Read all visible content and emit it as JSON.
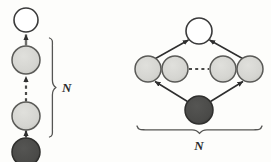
{
  "figure": {
    "background_color": "#fdfdfb"
  },
  "palette": {
    "observed_fill": "#4a4a48",
    "latent_fill": "#d5d5d1",
    "root_fill": "#ffffff",
    "stroke": "#3a3a3a",
    "dashed_stroke": "#4a4a48",
    "brace_stroke": "#555553",
    "label_color": "#2b2b2b"
  },
  "left_diagram": {
    "name": "chain-representation",
    "plate_label": "N",
    "nodes": [
      {
        "id": "L0",
        "kind": "root",
        "label": "",
        "fill": "root_fill",
        "cx": 26,
        "cy": 20,
        "r": 12
      },
      {
        "id": "L1",
        "kind": "latent",
        "label": "",
        "fill": "latent_fill",
        "cx": 26,
        "cy": 60,
        "r": 14
      },
      {
        "id": "L2",
        "kind": "latent",
        "label": "",
        "fill": "latent_fill",
        "cx": 26,
        "cy": 116,
        "r": 14
      },
      {
        "id": "L3",
        "kind": "observed",
        "label": "",
        "fill": "observed_fill",
        "cx": 26,
        "cy": 152,
        "r": 14
      }
    ],
    "edges": [
      {
        "from": "L1",
        "to": "L0",
        "style": "solid",
        "label": ""
      },
      {
        "from": "L2",
        "to": "L1",
        "style": "dashed",
        "label": ""
      },
      {
        "from": "L3",
        "to": "L2",
        "style": "solid",
        "label": ""
      }
    ],
    "brace": {
      "orientation": "vertical",
      "top": 38,
      "bottom": 137,
      "x": 53
    }
  },
  "right_diagram": {
    "name": "unrolled-plate-representation",
    "plate_label": "N",
    "nodes": [
      {
        "id": "R0",
        "kind": "root",
        "label": "",
        "fill": "root_fill",
        "cx": 199,
        "cy": 31,
        "r": 13
      },
      {
        "id": "R1",
        "kind": "latent",
        "label": "",
        "fill": "latent_fill",
        "cx": 148,
        "cy": 69,
        "r": 13
      },
      {
        "id": "R2",
        "kind": "latent",
        "label": "",
        "fill": "latent_fill",
        "cx": 175,
        "cy": 69,
        "r": 13
      },
      {
        "id": "R3",
        "kind": "latent",
        "label": "",
        "fill": "latent_fill",
        "cx": 223,
        "cy": 69,
        "r": 13
      },
      {
        "id": "R4",
        "kind": "latent",
        "label": "",
        "fill": "latent_fill",
        "cx": 250,
        "cy": 69,
        "r": 13
      },
      {
        "id": "R5",
        "kind": "observed",
        "label": "",
        "fill": "observed_fill",
        "cx": 199,
        "cy": 110,
        "r": 14
      }
    ],
    "edges": [
      {
        "from": "R1",
        "to": "R0",
        "style": "solid",
        "label": ""
      },
      {
        "from": "R4",
        "to": "R0",
        "style": "solid",
        "label": ""
      },
      {
        "from": "R5",
        "to": "R1",
        "style": "solid",
        "label": ""
      },
      {
        "from": "R5",
        "to": "R4",
        "style": "solid",
        "label": ""
      },
      {
        "from": "R2",
        "to": "R3",
        "style": "dashed",
        "label": ""
      }
    ],
    "brace": {
      "orientation": "horizontal",
      "left": 137,
      "right": 262,
      "y": 131
    }
  }
}
